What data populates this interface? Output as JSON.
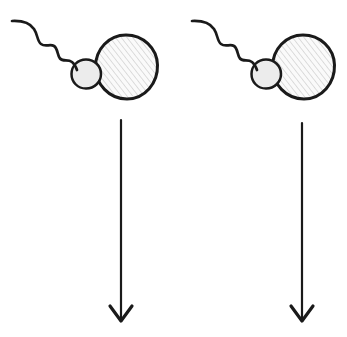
{
  "figure": {
    "width": 347,
    "height": 337,
    "background_color": "#ffffff",
    "ink_color": "#1a1a1a",
    "hatch_color": "#b9b9b9",
    "fill_color": "#f2f2f2",
    "panel_count": 2,
    "caption": ""
  },
  "panels": [
    {
      "id": "panel-left",
      "label": "",
      "cell": {
        "name": "sperm-cell",
        "tail": {
          "name": "flagellum",
          "start_x": 12,
          "start_y": 21,
          "end_x": 76,
          "end_y": 70,
          "wave_count": 3,
          "stroke_width": 2.6
        },
        "midpiece": {
          "name": "midpiece",
          "cx": 86,
          "cy": 74,
          "r": 14.5,
          "stroke_width": 2.4
        },
        "head": {
          "name": "head",
          "cx": 126,
          "cy": 67,
          "rx": 31,
          "ry": 32,
          "stroke_width": 3.0,
          "hatched": true
        }
      },
      "arrow": {
        "name": "downward-arrow",
        "x": 121,
        "y_start": 120,
        "y_end": 321,
        "head_half_width": 11,
        "head_height": 15,
        "stroke_width": 2.2,
        "direction": "down"
      }
    },
    {
      "id": "panel-right",
      "label": "",
      "cell": {
        "name": "sperm-cell",
        "tail": {
          "name": "flagellum",
          "start_x": 192,
          "start_y": 21,
          "end_x": 256,
          "end_y": 70,
          "wave_count": 3,
          "stroke_width": 2.6
        },
        "midpiece": {
          "name": "midpiece",
          "cx": 266,
          "cy": 74,
          "r": 14.5,
          "stroke_width": 2.4
        },
        "head": {
          "name": "head",
          "cx": 303,
          "cy": 67,
          "rx": 31,
          "ry": 32,
          "stroke_width": 3.0,
          "hatched": true
        }
      },
      "arrow": {
        "name": "downward-arrow",
        "x": 302,
        "y_start": 123,
        "y_end": 321,
        "head_half_width": 11,
        "head_height": 15,
        "stroke_width": 2.2,
        "direction": "down"
      }
    }
  ]
}
